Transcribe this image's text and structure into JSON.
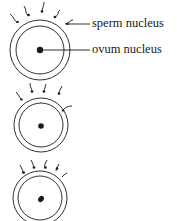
{
  "diagram": {
    "labels": {
      "sperm": "sperm nucleus",
      "ovum": "ovum nucleus"
    },
    "stages": [
      {
        "name": "stage-1",
        "description": "sperm approaching ovum"
      },
      {
        "name": "stage-2",
        "description": "one sperm penetrating outer membrane"
      },
      {
        "name": "stage-3",
        "description": "sperm nucleus fusing with ovum nucleus"
      }
    ],
    "colors": {
      "line": "#1a1a1a",
      "background": "#ffffff"
    }
  }
}
